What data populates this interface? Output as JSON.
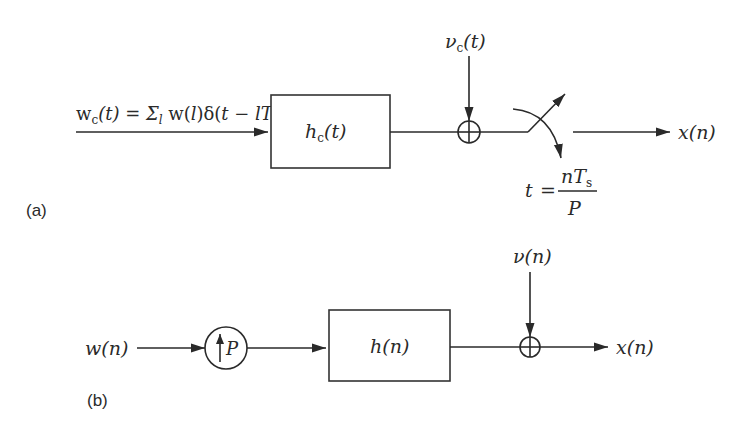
{
  "diagram": {
    "panel_a": {
      "label": "(a)",
      "input_label": {
        "w": "w",
        "w_sub": "c",
        "rest": "(t) = Σ",
        "sum_sub": "l",
        "w2": " w(",
        "l": "l",
        "delta": ")δ(",
        "t": "t",
        "minus": " − ",
        "lT": "lT",
        "s_sub": "s",
        "close": ")"
      },
      "filter": {
        "h": "h",
        "sub": "c",
        "arg": "(t)"
      },
      "noise": {
        "v": "ν",
        "sub": "c",
        "arg": "(t)"
      },
      "sampler": {
        "t": "t",
        "eq": "=",
        "numerator": "nT",
        "numerator_sub": "s",
        "denominator": "P"
      },
      "output_label": "x(n)"
    },
    "panel_b": {
      "label": "(b)",
      "input_label": "w(n)",
      "upsampler": {
        "symbol": "P"
      },
      "filter": "h(n)",
      "noise": "ν(n)",
      "output_label": "x(n)"
    },
    "colors": {
      "stroke": "#2a2a2a",
      "background": "#ffffff"
    }
  }
}
